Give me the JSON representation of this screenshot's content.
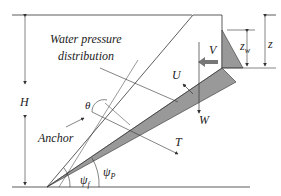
{
  "diagram": {
    "labels": {
      "water_pressure": "Water pressure",
      "distribution": "distribution",
      "H": "H",
      "z": "z",
      "z_w": "z",
      "z_w_sub": "w",
      "V": "V",
      "U": "U",
      "W": "W",
      "T": "T",
      "theta": "θ",
      "anchor": "Anchor",
      "psi_f": "ψ",
      "psi_f_sub": "f",
      "psi_p": "ψ",
      "psi_p_sub": "P"
    },
    "colors": {
      "line": "#333333",
      "shaded": "#999999",
      "arrow_fill": "#777777"
    }
  }
}
